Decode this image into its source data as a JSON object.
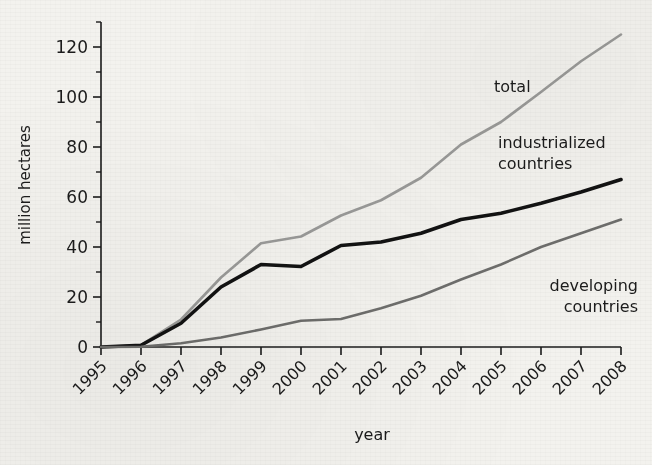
{
  "chart_data": {
    "type": "line",
    "title": "",
    "xlabel": "year",
    "ylabel": "million hectares",
    "x": [
      1995,
      1996,
      1997,
      1998,
      1999,
      2000,
      2001,
      2002,
      2003,
      2004,
      2005,
      2006,
      2007,
      2008
    ],
    "categories": [
      "1995",
      "1996",
      "1997",
      "1998",
      "1999",
      "2000",
      "2001",
      "2002",
      "2003",
      "2004",
      "2005",
      "2006",
      "2007",
      "2008"
    ],
    "xlim": [
      1995,
      2008
    ],
    "ylim": [
      0,
      130
    ],
    "ytick_values": [
      0,
      20,
      40,
      60,
      80,
      100,
      120
    ],
    "ytick_labels": [
      "0",
      "20",
      "40",
      "60",
      "80",
      "100",
      "120"
    ],
    "yminor_values": [
      10,
      30,
      50,
      70,
      90,
      110,
      130
    ],
    "grid": false,
    "legend_position": "inline-annotations",
    "series": [
      {
        "name": "total",
        "color": "#9a9a98",
        "width": 2.6,
        "values": [
          0,
          0.8,
          11.0,
          27.8,
          41.5,
          44.2,
          52.6,
          58.7,
          67.7,
          81.0,
          90.0,
          102.0,
          114.3,
          125.0
        ]
      },
      {
        "name": "industrialized countries",
        "color": "#121212",
        "width": 3.6,
        "values": [
          0,
          0.7,
          9.5,
          24.0,
          33.0,
          32.2,
          40.6,
          42.0,
          45.5,
          51.0,
          53.5,
          57.5,
          62.0,
          67.0
        ]
      },
      {
        "name": "developing countries",
        "color": "#6e6e6c",
        "width": 2.6,
        "values": [
          0,
          0.1,
          1.5,
          3.8,
          7.0,
          10.5,
          11.2,
          15.5,
          20.5,
          27.0,
          33.0,
          40.0,
          45.5,
          51.0
        ]
      }
    ],
    "annotations": [
      {
        "text": "total",
        "series": "total",
        "x_px": 494,
        "y_px": 92,
        "anchor": "start"
      },
      {
        "text": "industrialized",
        "series": "industrialized countries",
        "x_px": 498,
        "y_px": 148,
        "anchor": "start"
      },
      {
        "text": "countries",
        "series": "industrialized countries",
        "x_px": 498,
        "y_px": 168,
        "anchor": "start"
      },
      {
        "text": "developing",
        "series": "developing countries",
        "x_px": 636,
        "y_px": 290,
        "anchor": "end"
      },
      {
        "text": "countries",
        "series": "developing countries",
        "x_px": 636,
        "y_px": 310,
        "anchor": "end"
      }
    ]
  },
  "axes": {
    "ylabel": "million hectares",
    "xlabel": "year",
    "ytick_0": "0",
    "ytick_20": "20",
    "ytick_40": "40",
    "ytick_60": "60",
    "ytick_80": "80",
    "ytick_100": "100",
    "ytick_120": "120"
  },
  "labels": {
    "total": "total",
    "industrialized_line1": "industrialized",
    "industrialized_line2": "countries",
    "developing_line1": "developing",
    "developing_line2": "countries"
  },
  "xticks": {
    "t1995": "1995",
    "t1996": "1996",
    "t1997": "1997",
    "t1998": "1998",
    "t1999": "1999",
    "t2000": "2000",
    "t2001": "2001",
    "t2002": "2002",
    "t2003": "2003",
    "t2004": "2004",
    "t2005": "2005",
    "t2006": "2006",
    "t2007": "2007",
    "t2008": "2008"
  },
  "colors": {
    "total": "#9a9a98",
    "industrialized": "#121212",
    "developing": "#6e6e6c",
    "axis": "#1b1b1b",
    "background": "#f3f2ee"
  }
}
